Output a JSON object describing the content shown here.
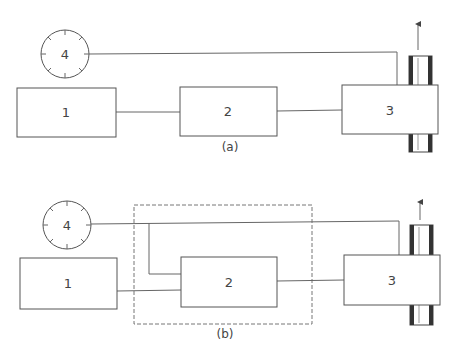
{
  "diagram_a": {
    "caption": "(a)",
    "dial_label": "4",
    "box1_label": "1",
    "box2_label": "2",
    "box3_label": "3"
  },
  "diagram_b": {
    "caption": "(b)",
    "dial_label": "4",
    "box1_label": "1",
    "box2_label": "2",
    "box3_label": "3"
  },
  "colors": {
    "line": "#666666",
    "shaft_dark": "#333333",
    "background": "#ffffff"
  }
}
